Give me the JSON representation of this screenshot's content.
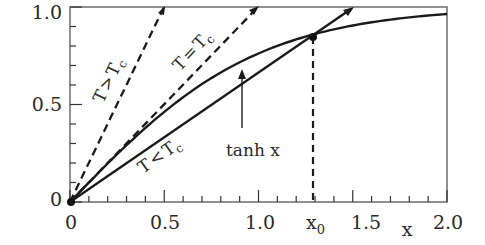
{
  "chart_data": {
    "type": "line",
    "title": "",
    "xlabel": "x",
    "ylabel": "",
    "xlim": [
      0,
      2.0
    ],
    "ylim": [
      0,
      1.0
    ],
    "grid": false,
    "legend": "none (inline curve labels)",
    "x_ticks": [
      {
        "value": 0,
        "label": "0"
      },
      {
        "value": 0.5,
        "label": "0.5"
      },
      {
        "value": 1.0,
        "label": "1.0"
      },
      {
        "value": 1.5,
        "label": "1.5"
      },
      {
        "value": 2.0,
        "label": "2.0"
      }
    ],
    "y_ticks": [
      {
        "value": 0,
        "label": "0"
      },
      {
        "value": 0.5,
        "label": "0.5"
      },
      {
        "value": 1.0,
        "label": "1.0"
      }
    ],
    "x_minor_step": 0.1,
    "y_minor_step": 0.1,
    "series": [
      {
        "name": "tanh x",
        "style": "solid",
        "function": "tanh(x)",
        "x": [
          0,
          0.25,
          0.5,
          0.75,
          1.0,
          1.25,
          1.5,
          1.75,
          2.0
        ],
        "y": [
          0,
          0.245,
          0.462,
          0.635,
          0.762,
          0.848,
          0.905,
          0.941,
          0.964
        ]
      },
      {
        "name": "T>Tc",
        "style": "dashed",
        "function": "2x",
        "x": [
          0,
          0.5
        ],
        "y": [
          0,
          1.0
        ]
      },
      {
        "name": "T=Tc",
        "style": "dashed",
        "function": "x",
        "x": [
          0,
          1.0
        ],
        "y": [
          0,
          1.0
        ]
      },
      {
        "name": "T<Tc",
        "style": "solid",
        "function": "0.667x",
        "x": [
          0,
          1.5
        ],
        "y": [
          0,
          1.0
        ]
      }
    ],
    "annotations": [
      {
        "text": "x0",
        "type": "marker",
        "x": 1.24,
        "y": 0.846,
        "note": "intersection of tanh x and T<Tc line, dashed drop line to x-axis"
      },
      {
        "text": "tanh x",
        "type": "arrow-label",
        "points_to": {
          "x": 0.92,
          "y": 0.68
        }
      },
      {
        "text": "T>Tc",
        "type": "rotated-label"
      },
      {
        "text": "T=Tc",
        "type": "rotated-label"
      },
      {
        "text": "T<Tc",
        "type": "rotated-label"
      }
    ]
  },
  "labels": {
    "y_0": "0",
    "y_05": "0.5",
    "y_1": "1.0",
    "x_0": "0",
    "x_05": "0.5",
    "x_1": "1.0",
    "x_15": "1.5",
    "x_2": "2.0",
    "x_axis_name": "x",
    "x0_main": "x",
    "x0_sub": "0",
    "tanh": "tanh x",
    "t_gt_T": "T",
    "t_gt_op": ">",
    "t_gt_Tc": "T",
    "t_gt_c": "c",
    "t_eq_T": "T",
    "t_eq_op": "=",
    "t_eq_Tc": "T",
    "t_eq_c": "c",
    "t_lt_T": "T",
    "t_lt_op": "<",
    "t_lt_Tc": "T",
    "t_lt_c": "c"
  },
  "colors": {
    "ink": "#1a1a1a",
    "text": "#2a2a2a",
    "background": "#ffffff"
  }
}
